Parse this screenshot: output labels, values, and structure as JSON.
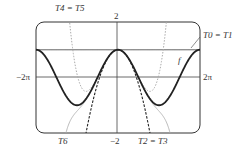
{
  "chart_data": {
    "type": "line",
    "title": "",
    "xlabel": "",
    "ylabel": "",
    "xlim": [
      -6.2832,
      6.2832
    ],
    "ylim": [
      -2,
      2
    ],
    "xtick_labels": {
      "left": "−2π",
      "right": "2π"
    },
    "ytick_labels": {
      "top": "2",
      "bottom": "−2"
    },
    "grid": false,
    "reference_lines": [
      {
        "y": 1
      }
    ],
    "series": [
      {
        "name": "f",
        "function": "cos(x)",
        "style": "solid-bold",
        "color": "#222222"
      },
      {
        "name": "T0 = T1",
        "function": "1",
        "style": "solid",
        "color": "#444444"
      },
      {
        "name": "T2 = T3",
        "function": "1 - x^2/2",
        "style": "dashed",
        "color": "#222222"
      },
      {
        "name": "T4 = T5",
        "function": "1 - x^2/2 + x^4/24",
        "style": "dotted",
        "color": "#aaaaaa"
      },
      {
        "name": "T6",
        "function": "1 - x^2/2 + x^4/24 - x^6/720",
        "style": "solid-thin",
        "color": "#aaaaaa"
      }
    ],
    "annotations": [
      "T4 = T5",
      "T0 = T1",
      "f",
      "T6",
      "T2 = T3"
    ]
  },
  "labels": {
    "t4t5": "T4 = T5",
    "t0t1": "T0 = T1",
    "f": "f",
    "t6": "T6",
    "t2t3": "T2 = T3",
    "y_top": "2",
    "y_bottom": "−2",
    "x_left": "−2π",
    "x_right": "2π"
  }
}
